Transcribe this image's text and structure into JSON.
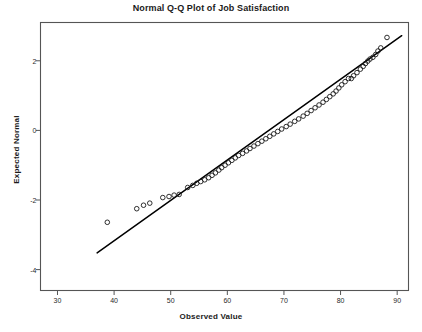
{
  "chart_data": {
    "type": "scatter",
    "title": "Normal Q-Q Plot of Job Satisfaction",
    "xlabel": "Observed Value",
    "ylabel": "Expected Normal",
    "xlim": [
      27,
      92
    ],
    "ylim": [
      -4.6,
      3.1
    ],
    "xticks": [
      30,
      40,
      50,
      60,
      70,
      80,
      90
    ],
    "xtick_labels": [
      "30",
      "40",
      "50",
      "60",
      "70",
      "80",
      "90"
    ],
    "yticks": [
      2,
      0,
      -2,
      -4
    ],
    "ytick_labels": [
      "2",
      "0",
      "-2",
      "-4"
    ],
    "grid": false,
    "legend": false,
    "marker": "open-circle",
    "marker_color": "#1a1a1a",
    "line_color": "#000000",
    "background_color": "#ffffff",
    "frame_color": "#555555",
    "reference_line": {
      "label": "normal reference line",
      "x": [
        37.0,
        90.8
      ],
      "y": [
        -3.52,
        2.72
      ]
    },
    "points": [
      {
        "x": 38.8,
        "y": -2.64
      },
      {
        "x": 44.0,
        "y": -2.25
      },
      {
        "x": 45.2,
        "y": -2.15
      },
      {
        "x": 46.3,
        "y": -2.09
      },
      {
        "x": 48.6,
        "y": -1.93
      },
      {
        "x": 49.7,
        "y": -1.9
      },
      {
        "x": 50.6,
        "y": -1.86
      },
      {
        "x": 51.5,
        "y": -1.84
      },
      {
        "x": 53.0,
        "y": -1.64
      },
      {
        "x": 53.9,
        "y": -1.58
      },
      {
        "x": 54.6,
        "y": -1.52
      },
      {
        "x": 55.3,
        "y": -1.47
      },
      {
        "x": 56.0,
        "y": -1.42
      },
      {
        "x": 56.7,
        "y": -1.36
      },
      {
        "x": 57.3,
        "y": -1.29
      },
      {
        "x": 57.9,
        "y": -1.22
      },
      {
        "x": 58.5,
        "y": -1.14
      },
      {
        "x": 59.0,
        "y": -1.07
      },
      {
        "x": 59.6,
        "y": -1.0
      },
      {
        "x": 60.2,
        "y": -0.93
      },
      {
        "x": 60.8,
        "y": -0.86
      },
      {
        "x": 61.4,
        "y": -0.79
      },
      {
        "x": 62.0,
        "y": -0.72
      },
      {
        "x": 62.7,
        "y": -0.66
      },
      {
        "x": 63.4,
        "y": -0.59
      },
      {
        "x": 64.0,
        "y": -0.52
      },
      {
        "x": 64.7,
        "y": -0.45
      },
      {
        "x": 65.4,
        "y": -0.38
      },
      {
        "x": 66.1,
        "y": -0.31
      },
      {
        "x": 66.8,
        "y": -0.24
      },
      {
        "x": 67.5,
        "y": -0.17
      },
      {
        "x": 68.2,
        "y": -0.1
      },
      {
        "x": 68.9,
        "y": -0.03
      },
      {
        "x": 69.6,
        "y": 0.04
      },
      {
        "x": 70.4,
        "y": 0.11
      },
      {
        "x": 71.1,
        "y": 0.18
      },
      {
        "x": 71.9,
        "y": 0.26
      },
      {
        "x": 72.6,
        "y": 0.33
      },
      {
        "x": 73.4,
        "y": 0.41
      },
      {
        "x": 74.1,
        "y": 0.49
      },
      {
        "x": 74.8,
        "y": 0.57
      },
      {
        "x": 75.5,
        "y": 0.65
      },
      {
        "x": 76.2,
        "y": 0.73
      },
      {
        "x": 76.9,
        "y": 0.81
      },
      {
        "x": 77.5,
        "y": 0.89
      },
      {
        "x": 78.1,
        "y": 0.97
      },
      {
        "x": 78.7,
        "y": 1.05
      },
      {
        "x": 79.2,
        "y": 1.13
      },
      {
        "x": 79.7,
        "y": 1.22
      },
      {
        "x": 80.2,
        "y": 1.31
      },
      {
        "x": 80.8,
        "y": 1.4
      },
      {
        "x": 81.4,
        "y": 1.49
      },
      {
        "x": 81.9,
        "y": 1.49
      },
      {
        "x": 82.3,
        "y": 1.57
      },
      {
        "x": 82.9,
        "y": 1.66
      },
      {
        "x": 83.5,
        "y": 1.76
      },
      {
        "x": 84.0,
        "y": 1.84
      },
      {
        "x": 84.4,
        "y": 1.92
      },
      {
        "x": 84.8,
        "y": 1.99
      },
      {
        "x": 85.2,
        "y": 2.05
      },
      {
        "x": 85.7,
        "y": 2.1
      },
      {
        "x": 86.2,
        "y": 2.18
      },
      {
        "x": 86.6,
        "y": 2.28
      },
      {
        "x": 87.1,
        "y": 2.37
      },
      {
        "x": 88.2,
        "y": 2.67
      }
    ]
  }
}
